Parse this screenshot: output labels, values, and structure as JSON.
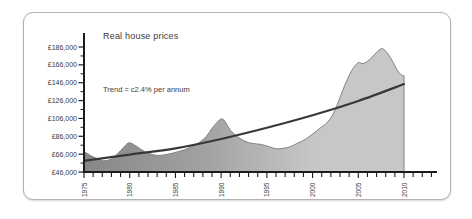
{
  "panel": {
    "border_color": "#b2b2b2",
    "background": "#ffffff"
  },
  "chart_data": {
    "type": "area",
    "title": "Real house prices",
    "annotation": "Trend = c2.4% per annum",
    "xlabel": "",
    "ylabel": "",
    "grid": false,
    "legend": "none",
    "y_axis": {
      "range": [
        46000,
        186000
      ],
      "tick_values": [
        46000,
        66000,
        86000,
        106000,
        126000,
        146000,
        166000,
        186000
      ],
      "tick_labels": [
        "£46,000",
        "£66,000",
        "£86,000",
        "£106,000",
        "£126,000",
        "£146,000",
        "£166,000",
        "£186,000"
      ],
      "minor_tick_values": [
        56000,
        76000,
        96000,
        116000,
        136000,
        156000,
        176000
      ]
    },
    "x_axis": {
      "first_tick_year": 1975,
      "last_tick_year": 2013,
      "tick_step": 1,
      "labeled_years": [
        1975,
        1980,
        1985,
        1990,
        1995,
        2000,
        2005,
        2010
      ],
      "labels": [
        "1975",
        "1980",
        "1985",
        "1990",
        "1995",
        "2000",
        "2005",
        "2010"
      ]
    },
    "series": [
      {
        "name": "Real house prices",
        "type": "area",
        "points": [
          [
            1975.0,
            69000
          ],
          [
            1975.8,
            64000
          ],
          [
            1976.6,
            60500
          ],
          [
            1977.3,
            58500
          ],
          [
            1978.2,
            62000
          ],
          [
            1979.0,
            70000
          ],
          [
            1979.7,
            77500
          ],
          [
            1980.1,
            78500
          ],
          [
            1980.8,
            74500
          ],
          [
            1981.6,
            69000
          ],
          [
            1982.5,
            65500
          ],
          [
            1983.2,
            64500
          ],
          [
            1984.2,
            66000
          ],
          [
            1985.2,
            68500
          ],
          [
            1986.0,
            71000
          ],
          [
            1986.8,
            74500
          ],
          [
            1987.6,
            79000
          ],
          [
            1988.4,
            86000
          ],
          [
            1989.0,
            95000
          ],
          [
            1989.6,
            102000
          ],
          [
            1990.0,
            105500
          ],
          [
            1990.4,
            103000
          ],
          [
            1991.0,
            93000
          ],
          [
            1991.8,
            85500
          ],
          [
            1992.6,
            80500
          ],
          [
            1993.4,
            78000
          ],
          [
            1994.3,
            77000
          ],
          [
            1995.2,
            74500
          ],
          [
            1996.0,
            72000
          ],
          [
            1996.8,
            72500
          ],
          [
            1997.6,
            74500
          ],
          [
            1998.4,
            78500
          ],
          [
            1999.2,
            82500
          ],
          [
            2000.0,
            88500
          ],
          [
            2000.8,
            95000
          ],
          [
            2001.5,
            100500
          ],
          [
            2002.2,
            110000
          ],
          [
            2002.8,
            124000
          ],
          [
            2003.4,
            140000
          ],
          [
            2004.0,
            154000
          ],
          [
            2004.5,
            163000
          ],
          [
            2005.0,
            168500
          ],
          [
            2005.5,
            167500
          ],
          [
            2006.0,
            170000
          ],
          [
            2006.5,
            174500
          ],
          [
            2007.0,
            180000
          ],
          [
            2007.5,
            184000
          ],
          [
            2007.9,
            182500
          ],
          [
            2008.4,
            176000
          ],
          [
            2008.9,
            167000
          ],
          [
            2009.3,
            159500
          ],
          [
            2009.7,
            155000
          ],
          [
            2010.0,
            154000
          ]
        ]
      },
      {
        "name": "Trend",
        "type": "line",
        "points": [
          [
            1975,
            58500
          ],
          [
            1980,
            65500
          ],
          [
            1985,
            72500
          ],
          [
            1990,
            83000
          ],
          [
            1995,
            95500
          ],
          [
            2000,
            109500
          ],
          [
            2005,
            125500
          ],
          [
            2010,
            144500
          ]
        ]
      }
    ],
    "colors": {
      "area_gradient_start": "#878787",
      "area_gradient_mid": "#a2a2a2",
      "area_gradient_end": "#c7c7c7",
      "area_outline": "#828282",
      "trend_line": "#383838",
      "axis": "#1b1b1b",
      "text": "#3c3c3c"
    }
  }
}
